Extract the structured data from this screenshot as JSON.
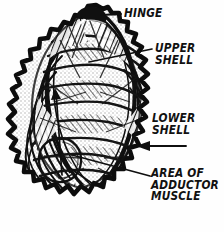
{
  "figure": {
    "style": "pen-and-ink hand drawing",
    "ink_color": "#111111",
    "background_color": "#fefefe"
  },
  "labels": {
    "hinge": {
      "lines": [
        "HINGE"
      ],
      "line1": "HINGE"
    },
    "upper_shell": {
      "lines": [
        "UPPER",
        "SHELL"
      ],
      "line1": "UPPER",
      "line2": "SHELL"
    },
    "lower_shell": {
      "lines": [
        "LOWER",
        "SHELL"
      ],
      "line1": "LOWER",
      "line2": "SHELL"
    },
    "adductor_muscle": {
      "lines": [
        "AREA OF",
        "ADDUCTOR",
        "MUSCLE"
      ],
      "line1": "AREA OF",
      "line2": "ADDUCTOR",
      "line3": "MUSCLE"
    }
  },
  "leaders": {
    "hinge": "short horizontal rule from label to shell hinge knob",
    "upper_shell": "angled rule from label into upper shell surface",
    "lower_shell": "left-pointing arrow from label to lower shell right edge",
    "adductor_muscle": "long angled rule from label to muscle scar circle"
  }
}
